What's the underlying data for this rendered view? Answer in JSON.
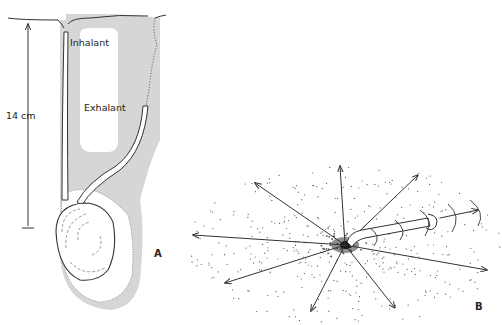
{
  "figure": {
    "panel_a": {
      "id_label": "A",
      "labels": {
        "inhalant": "Inhalant",
        "exhalant": "Exhalant",
        "scale": "14 cm"
      },
      "colors": {
        "sediment": "#d8d8d8",
        "outline": "#333333"
      }
    },
    "panel_b": {
      "id_label": "B",
      "arrow_count": 12,
      "colors": {
        "stipple": "#444444",
        "arrows": "#333333"
      }
    }
  }
}
